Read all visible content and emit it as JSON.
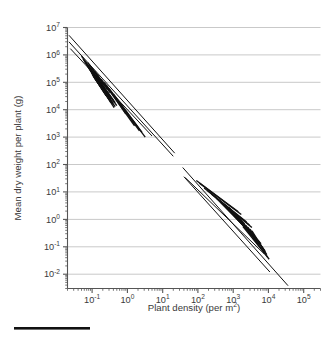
{
  "chart_data": {
    "type": "line",
    "title": "",
    "xlabel": "Plant density (per m",
    "xlabel_sup": "2",
    "xlabel_tail": ")",
    "ylabel": "Mean dry weight per plant (g)",
    "ylabel_plain": "Mean dry weight per plant (g)",
    "xscale": "log",
    "yscale": "log",
    "xlim": [
      0.02,
      300000
    ],
    "ylim": [
      0.003,
      10000000
    ],
    "grid": "horizontal",
    "legend": "none",
    "xticklabels": [
      "10-1",
      "100",
      "101",
      "102",
      "103",
      "104",
      "105"
    ],
    "xtick_bases": [
      "10",
      "10",
      "10",
      "10",
      "10",
      "10",
      "10"
    ],
    "xtick_exponents": [
      "-1",
      "0",
      "1",
      "2",
      "3",
      "4",
      "5"
    ],
    "xtick_values": [
      0.1,
      1,
      10,
      100,
      1000,
      10000,
      100000
    ],
    "ytick_bases": [
      "10",
      "10",
      "10",
      "10",
      "10",
      "10",
      "10",
      "10",
      "10",
      "10"
    ],
    "ytick_exponents": [
      "7",
      "6",
      "5",
      "4",
      "3",
      "2",
      "1",
      "0",
      "-1",
      "-2"
    ],
    "ytick_values": [
      10000000,
      1000000,
      100000,
      10000,
      1000,
      100,
      10,
      1,
      0.1,
      0.01
    ],
    "description": "Self-thinning -3/2 power law: two clusters of overlapping species trajectory lines, trees/large plants at low density upper-left and herbaceous stands at high density lower-right, all with slope about -3/2.",
    "line_color": "#111111",
    "grid_color": "#c9c9c9",
    "axis_color": "#555555",
    "series": [
      {
        "name": "upper-envelope-1",
        "group": "upper",
        "x": [
          0.022,
          22.0
        ],
        "y": [
          5200000,
          260
        ]
      },
      {
        "name": "upper-envelope-2",
        "group": "upper",
        "x": [
          0.022,
          20.0
        ],
        "y": [
          3000000,
          200
        ]
      },
      {
        "name": "upper-envelope-3",
        "group": "upper",
        "x": [
          0.024,
          5.0
        ],
        "y": [
          1700000,
          1100
        ]
      },
      {
        "name": "upper-trajectory-1",
        "group": "upper",
        "x": [
          0.05,
          0.45
        ],
        "y": [
          900000,
          18000
        ]
      },
      {
        "name": "upper-trajectory-2",
        "group": "upper",
        "x": [
          0.055,
          0.4
        ],
        "y": [
          700000,
          22000
        ]
      },
      {
        "name": "upper-trajectory-3",
        "group": "upper",
        "x": [
          0.06,
          0.5
        ],
        "y": [
          600000,
          14000
        ]
      },
      {
        "name": "upper-trajectory-4",
        "group": "upper",
        "x": [
          0.065,
          0.33
        ],
        "y": [
          520000,
          30000
        ]
      },
      {
        "name": "upper-trajectory-5",
        "group": "upper",
        "x": [
          0.07,
          0.3
        ],
        "y": [
          430000,
          33000
        ]
      },
      {
        "name": "upper-trajectory-6",
        "group": "upper",
        "x": [
          0.075,
          0.28
        ],
        "y": [
          380000,
          36000
        ]
      },
      {
        "name": "upper-trajectory-7",
        "group": "upper",
        "x": [
          0.08,
          0.26
        ],
        "y": [
          330000,
          38000
        ]
      },
      {
        "name": "upper-trajectory-8",
        "group": "upper",
        "x": [
          0.085,
          0.35
        ],
        "y": [
          300000,
          24000
        ]
      },
      {
        "name": "upper-trajectory-9",
        "group": "upper",
        "x": [
          0.09,
          0.3
        ],
        "y": [
          260000,
          28000
        ]
      },
      {
        "name": "upper-trajectory-10",
        "group": "upper",
        "x": [
          0.095,
          0.24
        ],
        "y": [
          230000,
          40000
        ]
      },
      {
        "name": "upper-trajectory-11",
        "group": "upper",
        "x": [
          0.1,
          0.22
        ],
        "y": [
          200000,
          43000
        ]
      },
      {
        "name": "upper-trajectory-12",
        "group": "upper",
        "x": [
          0.105,
          0.4
        ],
        "y": [
          180000,
          17000
        ]
      },
      {
        "name": "upper-trajectory-13",
        "group": "upper",
        "x": [
          0.11,
          0.28
        ],
        "y": [
          160000,
          28000
        ]
      },
      {
        "name": "upper-trajectory-14",
        "group": "upper",
        "x": [
          0.115,
          0.25
        ],
        "y": [
          150000,
          32000
        ]
      },
      {
        "name": "upper-trajectory-15",
        "group": "upper",
        "x": [
          0.12,
          0.45
        ],
        "y": [
          140000,
          13000
        ]
      },
      {
        "name": "upper-trajectory-16",
        "group": "upper",
        "x": [
          0.13,
          0.33
        ],
        "y": [
          120000,
          22000
        ]
      },
      {
        "name": "upper-trajectory-17",
        "group": "upper",
        "x": [
          0.14,
          0.3
        ],
        "y": [
          105000,
          24000
        ]
      },
      {
        "name": "upper-trajectory-18",
        "group": "upper",
        "x": [
          0.15,
          0.38
        ],
        "y": [
          95000,
          16000
        ]
      },
      {
        "name": "upper-trajectory-19",
        "group": "upper",
        "x": [
          0.16,
          0.34
        ],
        "y": [
          85000,
          18000
        ]
      },
      {
        "name": "upper-trajectory-20",
        "group": "upper",
        "x": [
          0.17,
          0.42
        ],
        "y": [
          75000,
          12000
        ]
      },
      {
        "name": "upper-trajectory-21",
        "group": "upper",
        "x": [
          0.075,
          0.17
        ],
        "y": [
          520000,
          120000
        ]
      },
      {
        "name": "upper-trajectory-22",
        "group": "upper",
        "x": [
          0.085,
          0.2
        ],
        "y": [
          420000,
          90000
        ]
      },
      {
        "name": "upper-trajectory-23",
        "group": "upper",
        "x": [
          0.1,
          0.23
        ],
        "y": [
          330000,
          70000
        ]
      },
      {
        "name": "upper-trajectory-24",
        "group": "upper",
        "x": [
          0.12,
          0.27
        ],
        "y": [
          250000,
          55000
        ]
      },
      {
        "name": "upper-trajectory-25",
        "group": "upper",
        "x": [
          0.14,
          0.32
        ],
        "y": [
          190000,
          42000
        ]
      },
      {
        "name": "upper-trajectory-26",
        "group": "upper",
        "x": [
          0.18,
          1.6
        ],
        "y": [
          130000,
          2600
        ]
      },
      {
        "name": "upper-trajectory-27",
        "group": "upper",
        "x": [
          0.22,
          2.2
        ],
        "y": [
          100000,
          1700
        ]
      },
      {
        "name": "upper-trajectory-28",
        "group": "upper",
        "x": [
          0.3,
          3.2
        ],
        "y": [
          60000,
          1000
        ]
      },
      {
        "name": "upper-trajectory-29",
        "group": "upper",
        "x": [
          0.26,
          0.9
        ],
        "y": [
          75000,
          7000
        ]
      },
      {
        "name": "upper-trajectory-30",
        "group": "upper",
        "x": [
          0.4,
          2.6
        ],
        "y": [
          38000,
          1500
        ]
      },
      {
        "name": "lower-envelope-1",
        "group": "lower",
        "x": [
          37.0,
          36000
        ],
        "y": [
          78,
          0.0038
        ]
      },
      {
        "name": "lower-envelope-2",
        "group": "lower",
        "x": [
          40.0,
          11000
        ],
        "y": [
          36,
          0.012
        ]
      },
      {
        "name": "lower-envelope-3",
        "group": "lower",
        "x": [
          44.0,
          7600
        ],
        "y": [
          33,
          0.055
        ]
      },
      {
        "name": "lower-trajectory-1",
        "group": "lower",
        "x": [
          330,
          6200
        ],
        "y": [
          6.0,
          0.13
        ]
      },
      {
        "name": "lower-trajectory-2",
        "group": "lower",
        "x": [
          420,
          5600
        ],
        "y": [
          4.6,
          0.15
        ]
      },
      {
        "name": "lower-trajectory-3",
        "group": "lower",
        "x": [
          520,
          5000
        ],
        "y": [
          3.6,
          0.17
        ]
      },
      {
        "name": "lower-trajectory-4",
        "group": "lower",
        "x": [
          600,
          4400
        ],
        "y": [
          3.0,
          0.2
        ]
      },
      {
        "name": "lower-trajectory-5",
        "group": "lower",
        "x": [
          700,
          4000
        ],
        "y": [
          2.6,
          0.22
        ]
      },
      {
        "name": "lower-trajectory-6",
        "group": "lower",
        "x": [
          820,
          3600
        ],
        "y": [
          2.2,
          0.26
        ]
      },
      {
        "name": "lower-trajectory-7",
        "group": "lower",
        "x": [
          950,
          3300
        ],
        "y": [
          1.8,
          0.3
        ]
      },
      {
        "name": "lower-trajectory-8",
        "group": "lower",
        "x": [
          1100,
          4800
        ],
        "y": [
          1.5,
          0.16
        ]
      },
      {
        "name": "lower-trajectory-9",
        "group": "lower",
        "x": [
          1250,
          4300
        ],
        "y": [
          1.3,
          0.19
        ]
      },
      {
        "name": "lower-trajectory-10",
        "group": "lower",
        "x": [
          1400,
          3900
        ],
        "y": [
          1.1,
          0.22
        ]
      },
      {
        "name": "lower-trajectory-11",
        "group": "lower",
        "x": [
          1600,
          6000
        ],
        "y": [
          0.95,
          0.11
        ]
      },
      {
        "name": "lower-trajectory-12",
        "group": "lower",
        "x": [
          1800,
          5400
        ],
        "y": [
          0.82,
          0.13
        ]
      },
      {
        "name": "lower-trajectory-13",
        "group": "lower",
        "x": [
          2000,
          4900
        ],
        "y": [
          0.7,
          0.15
        ]
      },
      {
        "name": "lower-trajectory-14",
        "group": "lower",
        "x": [
          2300,
          8000
        ],
        "y": [
          0.6,
          0.07
        ]
      },
      {
        "name": "lower-trajectory-15",
        "group": "lower",
        "x": [
          2600,
          7200
        ],
        "y": [
          0.52,
          0.082
        ]
      },
      {
        "name": "lower-trajectory-16",
        "group": "lower",
        "x": [
          3000,
          9000
        ],
        "y": [
          0.44,
          0.052
        ]
      },
      {
        "name": "lower-trajectory-17",
        "group": "lower",
        "x": [
          3400,
          8200
        ],
        "y": [
          0.38,
          0.062
        ]
      },
      {
        "name": "lower-trajectory-18",
        "group": "lower",
        "x": [
          150,
          2400
        ],
        "y": [
          14.0,
          0.8
        ]
      },
      {
        "name": "lower-trajectory-19",
        "group": "lower",
        "x": [
          190,
          2900
        ],
        "y": [
          11.0,
          0.62
        ]
      },
      {
        "name": "lower-trajectory-20",
        "group": "lower",
        "x": [
          240,
          3400
        ],
        "y": [
          8.5,
          0.5
        ]
      },
      {
        "name": "lower-trajectory-21",
        "group": "lower",
        "x": [
          90,
          1400
        ],
        "y": [
          26.0,
          1.9
        ]
      },
      {
        "name": "lower-trajectory-22",
        "group": "lower",
        "x": [
          110,
          1700
        ],
        "y": [
          21.0,
          1.5
        ]
      },
      {
        "name": "lower-trajectory-23",
        "group": "lower",
        "x": [
          1900,
          9500
        ],
        "y": [
          0.55,
          0.042
        ]
      },
      {
        "name": "lower-trajectory-24",
        "group": "lower",
        "x": [
          2800,
          10500
        ],
        "y": [
          0.34,
          0.035
        ]
      },
      {
        "name": "lower-trajectory-25",
        "group": "lower",
        "x": [
          1300,
          3000
        ],
        "y": [
          1.05,
          0.3
        ]
      },
      {
        "name": "lower-trajectory-26",
        "group": "lower",
        "x": [
          1600,
          3600
        ],
        "y": [
          0.8,
          0.24
        ]
      },
      {
        "name": "lower-trajectory-27",
        "group": "lower",
        "x": [
          2100,
          4600
        ],
        "y": [
          0.62,
          0.18
        ]
      },
      {
        "name": "lower-trajectory-28",
        "group": "lower",
        "x": [
          600,
          1700
        ],
        "y": [
          3.4,
          0.85
        ]
      },
      {
        "name": "lower-trajectory-29",
        "group": "lower",
        "x": [
          760,
          2100
        ],
        "y": [
          2.7,
          0.68
        ]
      }
    ]
  },
  "footer": {
    "rule_label": "black-rule"
  }
}
